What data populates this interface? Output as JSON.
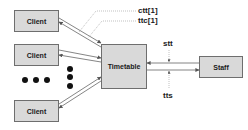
{
  "diagram": {
    "nodes": {
      "client1": "Client",
      "client2": "Client",
      "client3": "Client",
      "timetable": "Timetable",
      "staff": "Staff"
    },
    "labels": {
      "ctt": "ctt[1]",
      "ttc": "ttc[1]",
      "stt": "stt",
      "tts": "tts"
    },
    "edges": [
      {
        "from": "client1",
        "to": "timetable",
        "pair": true,
        "labels": [
          "ctt[1]",
          "ttc[1]"
        ]
      },
      {
        "from": "client2",
        "to": "timetable",
        "pair": true
      },
      {
        "from": "client3",
        "to": "timetable",
        "pair": true
      },
      {
        "from": "staff",
        "to": "timetable",
        "label": "stt"
      },
      {
        "from": "timetable",
        "to": "staff",
        "label": "tts"
      }
    ],
    "ellipsis": "more clients (dots)",
    "colors": {
      "box_fill": "#d9d9d9",
      "box_border": "#6e6e6e",
      "line": "#555555",
      "text": "#1a1a1a"
    }
  }
}
